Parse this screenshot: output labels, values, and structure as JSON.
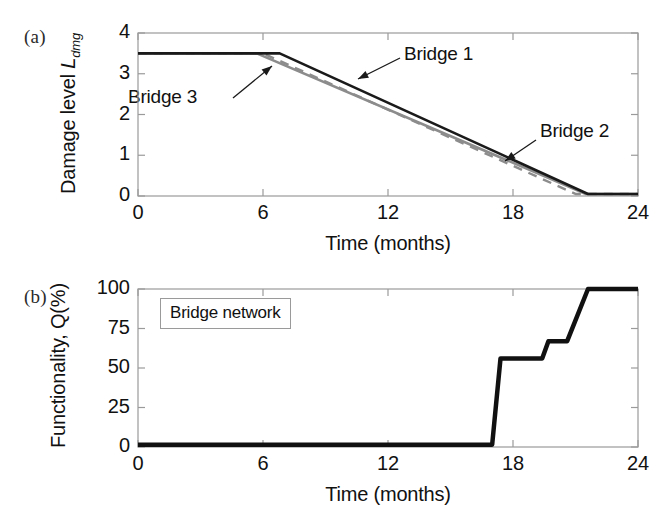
{
  "figure": {
    "width": 670,
    "height": 523,
    "background": "#ffffff",
    "line_colors": {
      "bridge1": "#1a1a1a",
      "bridge2": "#8c8c8c",
      "bridge3": "#8c8c8c",
      "network": "#111111",
      "axis": "#9a9a9a",
      "text": "#111111"
    }
  },
  "panel_a": {
    "tag": "(a)",
    "ylabel_text": "Damage level",
    "ylabel_symbol": "L",
    "ylabel_subscript": "dmg",
    "xlabel": "Time (months)",
    "yticks": [
      "0",
      "1",
      "2",
      "3",
      "4"
    ],
    "xticks": [
      "0",
      "6",
      "12",
      "18",
      "24"
    ],
    "annotations": [
      {
        "label": "Bridge 1",
        "x_month": 11.2,
        "y_value": 2.85
      },
      {
        "label": "Bridge 3",
        "x_month": 2.6,
        "y_value": 2.35
      },
      {
        "label": "Bridge 2",
        "x_month": 18.9,
        "y_value": 1.52
      }
    ]
  },
  "panel_b": {
    "tag": "(b)",
    "ylabel_text": "Functionality,",
    "ylabel_symbol": "Q(%)",
    "xlabel": "Time (months)",
    "yticks": [
      "0",
      "25",
      "50",
      "75",
      "100"
    ],
    "xticks": [
      "0",
      "6",
      "12",
      "18",
      "24"
    ],
    "legend_label": "Bridge network"
  },
  "chart_data": [
    {
      "type": "line",
      "panel": "a",
      "title": "",
      "xlabel": "Time (months)",
      "ylabel": "Damage level L_dmg",
      "xlim": [
        0,
        24
      ],
      "ylim": [
        0,
        4
      ],
      "xticks": [
        0,
        6,
        12,
        18,
        24
      ],
      "yticks": [
        0,
        1,
        2,
        3,
        4
      ],
      "grid": false,
      "legend": "annotated-arrows",
      "series": [
        {
          "name": "Bridge 1",
          "style": "solid",
          "color": "#1a1a1a",
          "width": 2.6,
          "x": [
            0,
            6.8,
            21.6,
            24
          ],
          "y": [
            3.5,
            3.5,
            0.05,
            0.05
          ]
        },
        {
          "name": "Bridge 2",
          "style": "dashed",
          "color": "#8c8c8c",
          "width": 2.4,
          "x": [
            0,
            6.0,
            21.0,
            24
          ],
          "y": [
            3.5,
            3.5,
            0.05,
            0.05
          ]
        },
        {
          "name": "Bridge 3",
          "style": "solid",
          "color": "#8c8c8c",
          "width": 2.6,
          "x": [
            0,
            5.7,
            21.5,
            24
          ],
          "y": [
            3.5,
            3.5,
            0.05,
            0.05
          ]
        }
      ]
    },
    {
      "type": "line",
      "panel": "b",
      "title": "",
      "xlabel": "Time (months)",
      "ylabel": "Functionality, Q(%)",
      "xlim": [
        0,
        24
      ],
      "ylim": [
        0,
        100
      ],
      "xticks": [
        0,
        6,
        12,
        18,
        24
      ],
      "yticks": [
        0,
        25,
        50,
        75,
        100
      ],
      "grid": false,
      "legend": "Bridge network",
      "series": [
        {
          "name": "Bridge network",
          "style": "solid",
          "color": "#111111",
          "width": 4.5,
          "x": [
            0,
            17.0,
            17.4,
            19.4,
            19.7,
            20.6,
            21.6,
            24
          ],
          "y": [
            1.5,
            1.5,
            56,
            56,
            67,
            67,
            100,
            100
          ]
        }
      ]
    }
  ]
}
